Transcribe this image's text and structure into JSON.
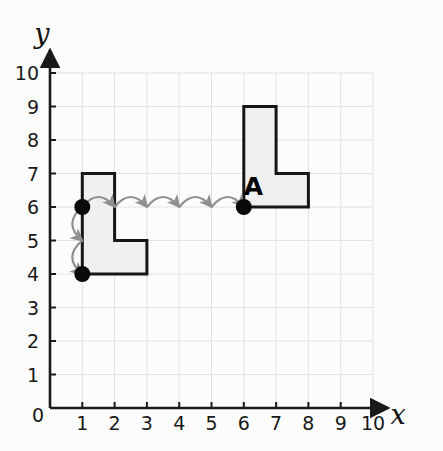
{
  "figure": {
    "title_letter": "A",
    "background_color": "#fcfcfc",
    "grid_color": "#e2e2e6",
    "axis_color": "#1a1a1a",
    "shape_stroke_color": "#161616",
    "shape_fill_color": "#f0f0f0",
    "arrow_color": "#8f8f8f",
    "point_color": "#0a0a0a"
  },
  "axes": {
    "x": {
      "label": "x",
      "ticks": [
        "1",
        "2",
        "3",
        "4",
        "5",
        "6",
        "7",
        "8",
        "9",
        "10"
      ],
      "min": 0,
      "max": 10
    },
    "y": {
      "label": "y",
      "ticks": [
        "1",
        "2",
        "3",
        "4",
        "5",
        "6",
        "7",
        "8",
        "9",
        "10"
      ],
      "min": 0,
      "max": 10
    },
    "origin_label": "0"
  },
  "chart_data": {
    "type": "scatter",
    "title": "",
    "xlabel": "x",
    "ylabel": "y",
    "xlim": [
      0,
      10
    ],
    "ylim": [
      0,
      10
    ],
    "grid": true,
    "legend": "none",
    "shapes": [
      {
        "name": "image-shape-left",
        "label": "",
        "vertices": [
          [
            1,
            7
          ],
          [
            2,
            7
          ],
          [
            2,
            5
          ],
          [
            3,
            5
          ],
          [
            3,
            4
          ],
          [
            1,
            4
          ]
        ],
        "filled": true
      },
      {
        "name": "object-shape-A",
        "label": "A",
        "label_position": [
          6.3,
          6.35
        ],
        "vertices": [
          [
            6,
            9
          ],
          [
            7,
            9
          ],
          [
            7,
            7
          ],
          [
            8,
            7
          ],
          [
            8,
            6
          ],
          [
            6,
            6
          ]
        ],
        "filled": true
      }
    ],
    "points": [
      {
        "name": "marked-point-left-upper",
        "x": 1,
        "y": 6
      },
      {
        "name": "marked-point-left-lower",
        "x": 1,
        "y": 4
      },
      {
        "name": "marked-point-A-origin",
        "x": 6,
        "y": 6
      }
    ],
    "arrows": [
      {
        "name": "horizontal-hop-1",
        "from": [
          1,
          6
        ],
        "to": [
          2,
          6
        ],
        "direction": "right",
        "style": "arc-over"
      },
      {
        "name": "horizontal-hop-2",
        "from": [
          2,
          6
        ],
        "to": [
          3,
          6
        ],
        "direction": "right",
        "style": "arc-over"
      },
      {
        "name": "horizontal-hop-3",
        "from": [
          3,
          6
        ],
        "to": [
          4,
          6
        ],
        "direction": "right",
        "style": "arc-over"
      },
      {
        "name": "horizontal-hop-4",
        "from": [
          4,
          6
        ],
        "to": [
          5,
          6
        ],
        "direction": "right",
        "style": "arc-over"
      },
      {
        "name": "horizontal-hop-5",
        "from": [
          5,
          6
        ],
        "to": [
          6,
          6
        ],
        "direction": "right",
        "style": "arc-over"
      },
      {
        "name": "vertical-hop-1",
        "from": [
          1,
          6
        ],
        "to": [
          1,
          5
        ],
        "direction": "down",
        "style": "arc-left"
      },
      {
        "name": "vertical-hop-2",
        "from": [
          1,
          5
        ],
        "to": [
          1,
          4
        ],
        "direction": "down",
        "style": "arc-left"
      }
    ]
  }
}
